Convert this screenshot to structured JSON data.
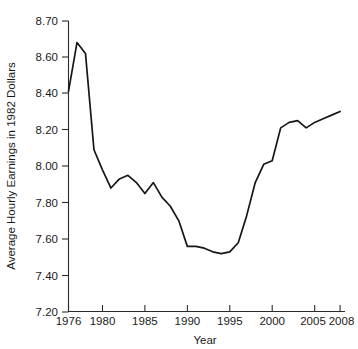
{
  "chart_data": {
    "type": "line",
    "title": "",
    "xlabel": "Year",
    "ylabel": "Average Hourly Earnings in 1982 Dollars",
    "grid": false,
    "legend": "none",
    "xlim": [
      1976,
      2008
    ],
    "ylim": [
      7.2,
      8.7
    ],
    "x_tick_labels": [
      "1976",
      "1980",
      "1985",
      "1990",
      "1995",
      "2000",
      "2005",
      "2008"
    ],
    "x_ticks": [
      1976,
      1980,
      1985,
      1990,
      1995,
      2000,
      2005,
      2008
    ],
    "y_tick_labels": [
      "8.70",
      "8.60",
      "8.40",
      "8.20",
      "8.00",
      "7.80",
      "7.60",
      "7.40",
      "7.20"
    ],
    "y_ticks": [
      8.7,
      8.6,
      8.4,
      8.2,
      8.0,
      7.8,
      7.6,
      7.4,
      7.2
    ],
    "y_axis_note": "top segment 8.60-8.70 is drawn at the same spacing as the 0.20 intervals below it",
    "x": [
      1976,
      1977,
      1978,
      1979,
      1980,
      1981,
      1982,
      1983,
      1984,
      1985,
      1986,
      1987,
      1988,
      1989,
      1990,
      1991,
      1992,
      1993,
      1994,
      1995,
      1996,
      1997,
      1998,
      1999,
      2000,
      2001,
      2002,
      2003,
      2004,
      2005,
      2006,
      2007,
      2008
    ],
    "series": [
      {
        "name": "Average Hourly Earnings in 1982 Dollars",
        "color": "#161616",
        "values": [
          8.41,
          8.64,
          8.61,
          8.09,
          7.98,
          7.88,
          7.93,
          7.95,
          7.91,
          7.85,
          7.91,
          7.83,
          7.78,
          7.7,
          7.56,
          7.56,
          7.55,
          7.53,
          7.52,
          7.53,
          7.58,
          7.73,
          7.91,
          8.01,
          8.03,
          8.21,
          8.24,
          8.25,
          8.21,
          8.24,
          8.26,
          8.28,
          8.3
        ]
      }
    ]
  }
}
